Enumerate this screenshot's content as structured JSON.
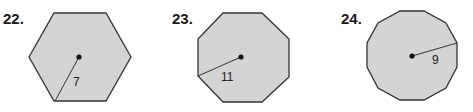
{
  "problems": [
    {
      "number": "22.",
      "shape": "regular hexagon",
      "sides": 6,
      "radius_label": "7",
      "fill": "#d4d4d4"
    },
    {
      "number": "23.",
      "shape": "regular octagon",
      "sides": 8,
      "radius_label": "11",
      "fill": "#d4d4d4"
    },
    {
      "number": "24.",
      "shape": "regular dodecagon",
      "sides": 12,
      "radius_label": "9",
      "fill": "#d4d4d4"
    }
  ]
}
